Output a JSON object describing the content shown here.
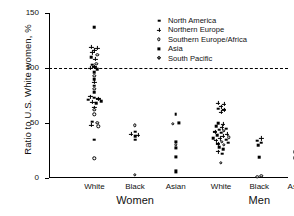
{
  "chart_data": {
    "type": "scatter",
    "title": "",
    "xlabel": "",
    "ylabel": "Ratio to U.S. White women, %",
    "ylim": [
      0,
      150
    ],
    "yticks": [
      0,
      50,
      100,
      150
    ],
    "ytick_labels": [
      "0",
      "50",
      "100",
      "150"
    ],
    "grid": false,
    "reference_line": {
      "value": 100,
      "style": "dashed",
      "label": "100"
    },
    "legend_position": "top-right",
    "legend": [
      {
        "label": "North America",
        "marker": "filled-square"
      },
      {
        "label": "Northern Europe",
        "marker": "filled-plus"
      },
      {
        "label": "Southern Europe/Africa",
        "marker": "open-circle"
      },
      {
        "label": "Asia",
        "marker": "filled-square-large"
      },
      {
        "label": "South Pacific",
        "marker": "open-diamond"
      }
    ],
    "group_labels": [
      "Women",
      "Men"
    ],
    "categories": [
      "White",
      "Black",
      "Asian",
      "White",
      "Black",
      "Asian"
    ],
    "category_groups": [
      "Women",
      "Women",
      "Women",
      "Men",
      "Men",
      "Men"
    ],
    "series": [
      {
        "name": "Women White",
        "category": "White",
        "group": "Women",
        "x_center_pct": 19,
        "points": [
          {
            "v": 137,
            "marker": "filled-square",
            "dx": 0
          },
          {
            "v": 119,
            "marker": "filled-plus",
            "dx": -3
          },
          {
            "v": 118,
            "marker": "filled-plus",
            "dx": 3
          },
          {
            "v": 116,
            "marker": "filled-plus",
            "dx": 0
          },
          {
            "v": 114,
            "marker": "filled-plus",
            "dx": -2
          },
          {
            "v": 112,
            "marker": "open-circle",
            "dx": 3
          },
          {
            "v": 110,
            "marker": "filled-square",
            "dx": -3
          },
          {
            "v": 108,
            "marker": "filled-plus",
            "dx": 1
          },
          {
            "v": 104,
            "marker": "open-circle",
            "dx": 2
          },
          {
            "v": 103,
            "marker": "filled-square",
            "dx": -2
          },
          {
            "v": 101,
            "marker": "filled-plus",
            "dx": 0
          },
          {
            "v": 100,
            "marker": "filled-plus",
            "dx": -4
          },
          {
            "v": 99,
            "marker": "filled-square",
            "dx": 3
          },
          {
            "v": 96,
            "marker": "filled-square",
            "dx": 0
          },
          {
            "v": 93,
            "marker": "open-circle",
            "dx": 0
          },
          {
            "v": 90,
            "marker": "filled-square",
            "dx": 0
          },
          {
            "v": 87,
            "marker": "filled-plus",
            "dx": 0
          },
          {
            "v": 84,
            "marker": "filled-square",
            "dx": 0
          },
          {
            "v": 81,
            "marker": "open-circle",
            "dx": 0
          },
          {
            "v": 78,
            "marker": "filled-square",
            "dx": 0
          },
          {
            "v": 74,
            "marker": "filled-plus",
            "dx": -4
          },
          {
            "v": 73,
            "marker": "filled-square",
            "dx": 0
          },
          {
            "v": 72,
            "marker": "filled-plus",
            "dx": 4
          },
          {
            "v": 71,
            "marker": "filled-square",
            "dx": -6
          },
          {
            "v": 70,
            "marker": "filled-square",
            "dx": 7
          },
          {
            "v": 69,
            "marker": "filled-plus",
            "dx": -2
          },
          {
            "v": 68,
            "marker": "filled-square",
            "dx": 2
          },
          {
            "v": 64,
            "marker": "filled-plus",
            "dx": 0
          },
          {
            "v": 62,
            "marker": "open-circle",
            "dx": 0
          },
          {
            "v": 58,
            "marker": "open-circle",
            "dx": 0
          },
          {
            "v": 51,
            "marker": "filled-square",
            "dx": -2
          },
          {
            "v": 50,
            "marker": "open-circle",
            "dx": 3
          },
          {
            "v": 48,
            "marker": "filled-plus",
            "dx": -3
          },
          {
            "v": 47,
            "marker": "open-circle",
            "dx": 4
          },
          {
            "v": 35,
            "marker": "filled-square",
            "dx": 0
          },
          {
            "v": 18,
            "marker": "open-circle",
            "dx": 0
          }
        ]
      },
      {
        "name": "Women Black",
        "category": "Black",
        "group": "Women",
        "x_center_pct": 36,
        "points": [
          {
            "v": 48,
            "marker": "open-circle",
            "dx": 0
          },
          {
            "v": 42,
            "marker": "filled-square",
            "dx": 0
          },
          {
            "v": 40,
            "marker": "filled-plus",
            "dx": -4
          },
          {
            "v": 39,
            "marker": "filled-plus",
            "dx": 3
          },
          {
            "v": 38,
            "marker": "filled-square",
            "dx": 0
          },
          {
            "v": 35,
            "marker": "filled-square",
            "dx": 0
          },
          {
            "v": 3,
            "marker": "open-circle",
            "dx": 0
          }
        ]
      },
      {
        "name": "Women Asian",
        "category": "Asian",
        "group": "Women",
        "x_center_pct": 53,
        "points": [
          {
            "v": 58,
            "marker": "filled-square",
            "dx": 0
          },
          {
            "v": 50,
            "marker": "filled-square-large",
            "dx": 3
          },
          {
            "v": 49,
            "marker": "open-circle",
            "dx": -3
          },
          {
            "v": 33,
            "marker": "filled-square-large",
            "dx": 0
          },
          {
            "v": 30,
            "marker": "open-circle",
            "dx": 0
          },
          {
            "v": 27,
            "marker": "filled-square-large",
            "dx": 0
          },
          {
            "v": 19,
            "marker": "filled-square-large",
            "dx": 0
          },
          {
            "v": 6,
            "marker": "filled-square-large",
            "dx": 0
          }
        ]
      },
      {
        "name": "Men White",
        "category": "White",
        "group": "Men",
        "x_center_pct": 72,
        "points": [
          {
            "v": 68,
            "marker": "filled-plus",
            "dx": -3
          },
          {
            "v": 67,
            "marker": "filled-plus",
            "dx": 3
          },
          {
            "v": 65,
            "marker": "filled-plus",
            "dx": 0
          },
          {
            "v": 63,
            "marker": "filled-square",
            "dx": -3
          },
          {
            "v": 62,
            "marker": "filled-plus",
            "dx": 3
          },
          {
            "v": 60,
            "marker": "filled-plus",
            "dx": 0
          },
          {
            "v": 50,
            "marker": "filled-square",
            "dx": -3
          },
          {
            "v": 49,
            "marker": "filled-plus",
            "dx": 2
          },
          {
            "v": 47,
            "marker": "filled-square",
            "dx": -5
          },
          {
            "v": 46,
            "marker": "filled-plus",
            "dx": 1
          },
          {
            "v": 45,
            "marker": "filled-square",
            "dx": 5
          },
          {
            "v": 44,
            "marker": "filled-square",
            "dx": -2
          },
          {
            "v": 43,
            "marker": "open-circle",
            "dx": 3
          },
          {
            "v": 42,
            "marker": "filled-plus",
            "dx": -6
          },
          {
            "v": 41,
            "marker": "filled-square",
            "dx": 0
          },
          {
            "v": 40,
            "marker": "filled-plus",
            "dx": 6
          },
          {
            "v": 39,
            "marker": "filled-square",
            "dx": -4
          },
          {
            "v": 38,
            "marker": "filled-plus",
            "dx": 2
          },
          {
            "v": 37,
            "marker": "open-circle",
            "dx": 8
          },
          {
            "v": 36,
            "marker": "filled-square",
            "dx": -8
          },
          {
            "v": 36,
            "marker": "filled-plus",
            "dx": -1
          },
          {
            "v": 35,
            "marker": "filled-square",
            "dx": 5
          },
          {
            "v": 34,
            "marker": "filled-plus",
            "dx": -5
          },
          {
            "v": 33,
            "marker": "open-circle",
            "dx": 1
          },
          {
            "v": 32,
            "marker": "filled-square",
            "dx": 7
          },
          {
            "v": 31,
            "marker": "filled-plus",
            "dx": -3
          },
          {
            "v": 30,
            "marker": "open-circle",
            "dx": 3
          },
          {
            "v": 28,
            "marker": "filled-square",
            "dx": -2
          },
          {
            "v": 26,
            "marker": "filled-square",
            "dx": 2
          },
          {
            "v": 24,
            "marker": "filled-plus",
            "dx": -3
          },
          {
            "v": 22,
            "marker": "filled-square",
            "dx": 1
          },
          {
            "v": 14,
            "marker": "open-circle",
            "dx": 0
          }
        ]
      },
      {
        "name": "Men Black",
        "category": "Black",
        "group": "Men",
        "x_center_pct": 88,
        "points": [
          {
            "v": 36,
            "marker": "filled-plus",
            "dx": 2
          },
          {
            "v": 34,
            "marker": "filled-square",
            "dx": -2
          },
          {
            "v": 32,
            "marker": "filled-square",
            "dx": 2
          },
          {
            "v": 30,
            "marker": "filled-square",
            "dx": -1
          },
          {
            "v": 19,
            "marker": "filled-square",
            "dx": 0
          },
          {
            "v": 2,
            "marker": "open-circle",
            "dx": 2
          },
          {
            "v": 1,
            "marker": "open-circle",
            "dx": -2
          }
        ]
      },
      {
        "name": "Men Asian",
        "category": "Asian",
        "group": "Men",
        "x_center_pct": 104,
        "points": [
          {
            "v": 34,
            "marker": "filled-square-large",
            "dx": 0
          },
          {
            "v": 26,
            "marker": "open-diamond",
            "dx": 3
          },
          {
            "v": 24,
            "marker": "filled-square-large",
            "dx": -3
          },
          {
            "v": 22,
            "marker": "filled-square-large",
            "dx": 1
          },
          {
            "v": 18,
            "marker": "filled-square-large",
            "dx": -3
          },
          {
            "v": 17,
            "marker": "open-circle",
            "dx": 3
          },
          {
            "v": 15,
            "marker": "filled-square-large",
            "dx": -1
          },
          {
            "v": 13,
            "marker": "filled-square-large",
            "dx": -2
          },
          {
            "v": 11,
            "marker": "filled-square-large",
            "dx": 2
          }
        ]
      }
    ]
  },
  "axis": {
    "y_title": "Ratio to U.S. White women, %",
    "y_ticks": [
      "150",
      "100",
      "50",
      "0"
    ],
    "x_categories": [
      "White",
      "Black",
      "Asian",
      "White",
      "Black",
      "Asian"
    ],
    "x_groups": [
      "Women",
      "Men"
    ]
  }
}
